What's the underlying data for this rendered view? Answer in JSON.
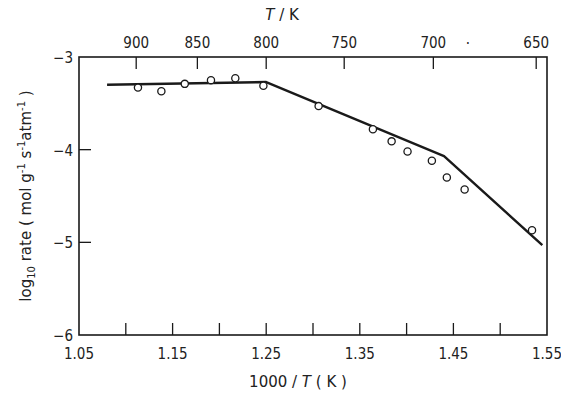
{
  "chart_data": {
    "type": "scatter",
    "title": "",
    "xlabel": "1000 / T (K)",
    "ylabel": "log10 rate ( mol g^-1 s^-1 atm^-1 )",
    "top_axis_label": "T / K",
    "xlim": [
      1.05,
      1.55
    ],
    "ylim": [
      -6,
      -3
    ],
    "grid": false,
    "legend": null,
    "x_ticks": [
      1.05,
      1.1,
      1.15,
      1.2,
      1.25,
      1.3,
      1.35,
      1.4,
      1.45,
      1.5,
      1.55
    ],
    "x_tick_labels": [
      "1.05",
      "",
      "1.15",
      "",
      "1.25",
      "",
      "1.35",
      "",
      "1.45",
      "",
      "1.55"
    ],
    "y_ticks": [
      -3,
      -4,
      -5,
      -6
    ],
    "y_tick_labels": [
      "-3",
      "-4",
      "-5",
      "-6"
    ],
    "top_ticks": [
      900,
      850,
      800,
      750,
      700,
      650
    ],
    "top_tick_labels": [
      "900",
      "850",
      "800",
      "750",
      "700",
      "650"
    ],
    "stray_mark": ".",
    "series": [
      {
        "name": "measured rate",
        "kind": "open-circle markers",
        "x": [
          1.113,
          1.138,
          1.163,
          1.191,
          1.217,
          1.247,
          1.306,
          1.364,
          1.384,
          1.401,
          1.427,
          1.443,
          1.462,
          1.534
        ],
        "y": [
          -3.33,
          -3.37,
          -3.29,
          -3.25,
          -3.23,
          -3.31,
          -3.53,
          -3.78,
          -3.91,
          -4.02,
          -4.12,
          -4.3,
          -4.43,
          -4.87
        ]
      },
      {
        "name": "fitted piecewise line",
        "kind": "solid line",
        "x": [
          1.08,
          1.25,
          1.44,
          1.545
        ],
        "y": [
          -3.3,
          -3.27,
          -4.07,
          -5.03
        ]
      }
    ]
  },
  "labels": {
    "xlabel_main": "1000 / ",
    "xlabel_var": "T",
    "xlabel_unit": " ( K )",
    "top_var": "T",
    "top_unit": " / K",
    "ylabel_prefix": "log",
    "ylabel_sub": "10",
    "ylabel_rest": " rate ( mol g",
    "ylabel_e1": "-1",
    "ylabel_s": " s",
    "ylabel_e2": "-1",
    "ylabel_atm": "atm",
    "ylabel_e3": "-1",
    "ylabel_close": " )"
  }
}
